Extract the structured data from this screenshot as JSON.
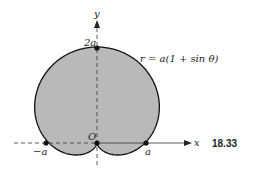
{
  "diagram": {
    "equation": "r = a(1 + sin θ)",
    "figure_number": "18.33",
    "axes": {
      "x_label": "x",
      "y_label": "y"
    },
    "labels": {
      "origin": "O",
      "top": "2a",
      "left": "−a",
      "right": "a"
    },
    "points": [
      {
        "name": "top",
        "label": "2a"
      },
      {
        "name": "origin",
        "label": "O"
      },
      {
        "name": "left",
        "label": "−a"
      },
      {
        "name": "right",
        "label": "a"
      }
    ],
    "colors": {
      "fill": "#b9b9b9",
      "stroke": "#111111",
      "axis": "#333333"
    }
  }
}
